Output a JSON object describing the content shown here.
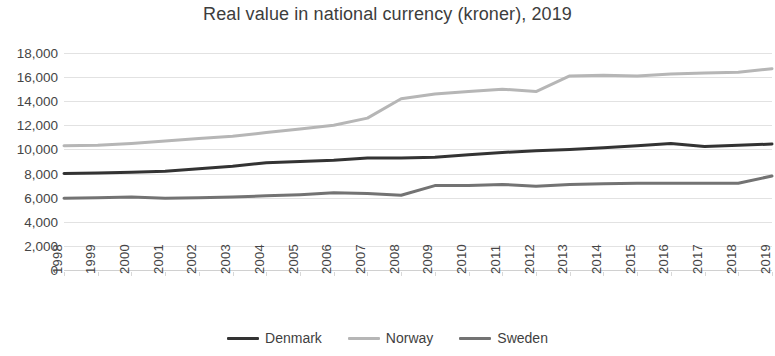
{
  "chart_data": {
    "type": "line",
    "title": "Real value in national currency (kroner), 2019",
    "xlabel": "",
    "ylabel": "",
    "grid": true,
    "legend_position": "bottom",
    "ylim": [
      0,
      18000
    ],
    "ytick_labels": [
      "18,000",
      "16,000",
      "14,000",
      "12,000",
      "10,000",
      "8,000",
      "6,000",
      "4,000",
      "2,000",
      "0"
    ],
    "ytick_values": [
      18000,
      16000,
      14000,
      12000,
      10000,
      8000,
      6000,
      4000,
      2000,
      0
    ],
    "categories": [
      "1998",
      "1999",
      "2000",
      "2001",
      "2002",
      "2003",
      "2004",
      "2005",
      "2006",
      "2007",
      "2008",
      "2009",
      "2010",
      "2011",
      "2012",
      "2013",
      "2014",
      "2015",
      "2016",
      "2017",
      "2018",
      "2019"
    ],
    "series": [
      {
        "name": "Denmark",
        "color": "#333333",
        "values": [
          8000,
          8050,
          8100,
          8200,
          8400,
          8600,
          8900,
          9000,
          9100,
          9300,
          9300,
          9350,
          9550,
          9750,
          9900,
          10000,
          10150,
          10300,
          10500,
          10250,
          10350,
          10450
        ]
      },
      {
        "name": "Norway",
        "color": "#b6b6b6",
        "values": [
          10300,
          10350,
          10500,
          10700,
          10900,
          11100,
          11400,
          11700,
          12000,
          12600,
          14200,
          14600,
          14800,
          15000,
          14800,
          16100,
          16150,
          16100,
          16250,
          16350,
          16400,
          16700
        ]
      },
      {
        "name": "Sweden",
        "color": "#737373",
        "values": [
          5950,
          6000,
          6050,
          5950,
          6000,
          6050,
          6150,
          6250,
          6400,
          6350,
          6200,
          7000,
          7000,
          7100,
          6950,
          7100,
          7150,
          7200,
          7200,
          7200,
          7200,
          7800
        ]
      }
    ]
  },
  "legend": {
    "items": [
      {
        "label": "Denmark"
      },
      {
        "label": "Norway"
      },
      {
        "label": "Sweden"
      }
    ]
  }
}
